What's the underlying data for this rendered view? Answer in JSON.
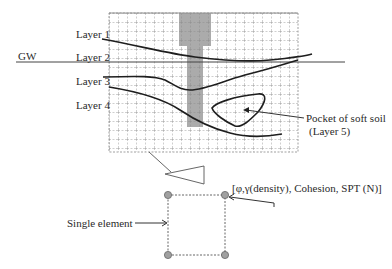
{
  "diagram": {
    "labels": {
      "gw": "GW",
      "layer1": "Layer 1",
      "layer2": "Layer 2",
      "layer3": "Layer 3",
      "layer4": "Layer 4",
      "pocket_line1": "Pocket of soft soil",
      "pocket_line2": "(Layer 5)",
      "properties": "[φ,γ(density), Cohesion, SPT (N)]",
      "single_element": "Single element"
    },
    "colors": {
      "grid": "#777777",
      "shade": "#a9a9a9",
      "curve": "#1e1e1e",
      "node_fill": "#a0a0a0"
    }
  }
}
